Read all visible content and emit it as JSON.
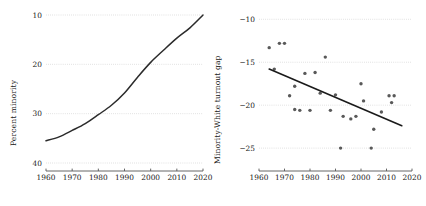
{
  "chart_data": [
    {
      "panel": "left",
      "type": "line",
      "title": "",
      "xlabel": "",
      "ylabel": "Percent minority",
      "xlim": [
        1960,
        2020
      ],
      "ylim": [
        10,
        40
      ],
      "xticks": [
        1960,
        1970,
        1980,
        1990,
        2000,
        2010,
        2020
      ],
      "yticks": [
        10,
        20,
        30,
        40
      ],
      "grid": true,
      "grid_style": "dotted",
      "legend": "none",
      "line_color": "#2b2b2b",
      "x": [
        1960,
        1965,
        1970,
        1975,
        1980,
        1985,
        1990,
        1995,
        2000,
        2005,
        2010,
        2015,
        2020
      ],
      "values": [
        14.5,
        15.3,
        16.6,
        18.0,
        19.8,
        21.7,
        24.2,
        27.4,
        30.4,
        32.9,
        35.3,
        37.4,
        40.0
      ]
    },
    {
      "panel": "right",
      "type": "scatter",
      "title": "",
      "xlabel": "",
      "ylabel": "Minority-White turnout gap",
      "xlim": [
        1960,
        2020
      ],
      "ylim": [
        -26.5,
        -9.5
      ],
      "xticks": [
        1960,
        1970,
        1980,
        1990,
        2000,
        2010,
        2020
      ],
      "yticks": [
        -10,
        -15,
        -20,
        -25
      ],
      "grid": true,
      "grid_style": "dotted",
      "legend": "none",
      "point_color": "#595959",
      "trend_color": "#1a1a1a",
      "points": [
        {
          "x": 1964,
          "y": -13.3
        },
        {
          "x": 1966,
          "y": -15.8
        },
        {
          "x": 1968,
          "y": -12.8
        },
        {
          "x": 1970,
          "y": -12.8
        },
        {
          "x": 1972,
          "y": -18.9
        },
        {
          "x": 1974,
          "y": -17.8
        },
        {
          "x": 1974,
          "y": -20.5
        },
        {
          "x": 1976,
          "y": -20.6
        },
        {
          "x": 1978,
          "y": -16.3
        },
        {
          "x": 1980,
          "y": -20.6
        },
        {
          "x": 1982,
          "y": -16.2
        },
        {
          "x": 1984,
          "y": -18.6
        },
        {
          "x": 1986,
          "y": -14.4
        },
        {
          "x": 1988,
          "y": -20.6
        },
        {
          "x": 1990,
          "y": -18.8
        },
        {
          "x": 1992,
          "y": -25.0
        },
        {
          "x": 1993,
          "y": -21.3
        },
        {
          "x": 1996,
          "y": -21.6
        },
        {
          "x": 1998,
          "y": -21.3
        },
        {
          "x": 2000,
          "y": -17.5
        },
        {
          "x": 2001,
          "y": -19.5
        },
        {
          "x": 2004,
          "y": -25.0
        },
        {
          "x": 2005,
          "y": -22.8
        },
        {
          "x": 2008,
          "y": -20.8
        },
        {
          "x": 2011,
          "y": -18.9
        },
        {
          "x": 2012,
          "y": -19.7
        },
        {
          "x": 2013,
          "y": -18.9
        }
      ],
      "trendline": {
        "x": [
          1964,
          2016
        ],
        "y": [
          -15.8,
          -22.4
        ]
      }
    }
  ],
  "panels": {
    "left": {
      "ylabel": "Percent minority",
      "yticklabels": [
        "40",
        "30",
        "20",
        "10"
      ],
      "xticklabels": [
        "1960",
        "1970",
        "1980",
        "1990",
        "2000",
        "2010",
        "2020"
      ]
    },
    "right": {
      "ylabel": "Minority-White turnout gap",
      "yticklabels": [
        "−10",
        "−15",
        "−20",
        "−25"
      ],
      "xticklabels": [
        "1960",
        "1970",
        "1980",
        "1990",
        "2000",
        "2010",
        "2020"
      ]
    }
  },
  "colors": {
    "line": "#2b2b2b",
    "point": "#595959",
    "grid": "#cccccc",
    "axis": "#555555",
    "text": "#1a1a1a",
    "background": "#ffffff"
  }
}
